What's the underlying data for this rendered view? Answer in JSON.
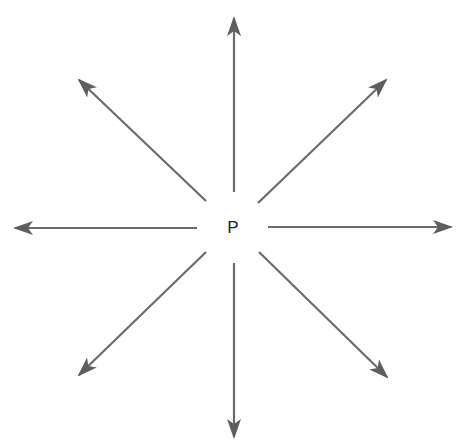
{
  "diagram": {
    "center_label": "P",
    "center": {
      "x": 233,
      "y": 228
    },
    "line_color": "#6b6b6b",
    "head_color": "#5e5e5e",
    "arrows": [
      {
        "name": "arrow-up",
        "x1": 234,
        "y1": 192,
        "x2": 234,
        "y2": 18
      },
      {
        "name": "arrow-down",
        "x1": 234,
        "y1": 263,
        "x2": 234,
        "y2": 437
      },
      {
        "name": "arrow-left",
        "x1": 197,
        "y1": 228,
        "x2": 15,
        "y2": 228
      },
      {
        "name": "arrow-right",
        "x1": 268,
        "y1": 227,
        "x2": 451,
        "y2": 227
      },
      {
        "name": "arrow-up-left",
        "x1": 206,
        "y1": 201,
        "x2": 79,
        "y2": 80
      },
      {
        "name": "arrow-up-right",
        "x1": 258,
        "y1": 203,
        "x2": 386,
        "y2": 80
      },
      {
        "name": "arrow-down-left",
        "x1": 206,
        "y1": 252,
        "x2": 79,
        "y2": 375
      },
      {
        "name": "arrow-down-right",
        "x1": 259,
        "y1": 252,
        "x2": 387,
        "y2": 377
      }
    ]
  }
}
